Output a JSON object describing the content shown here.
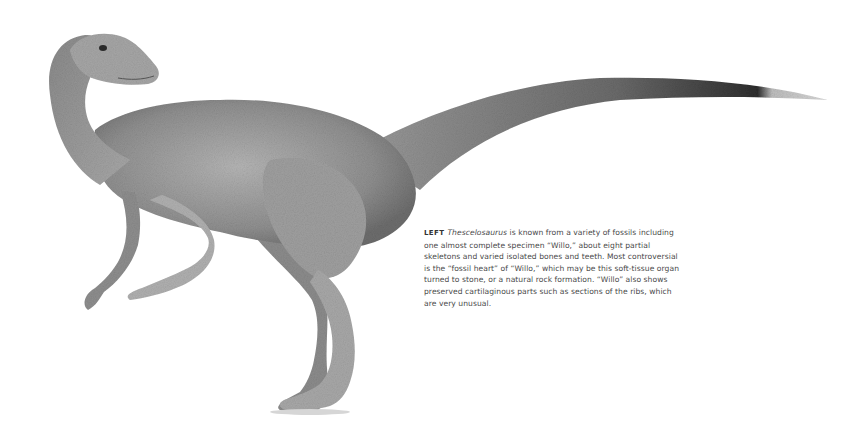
{
  "illustration": {
    "subject": "Thescelosaurus",
    "description": "Grayscale painted illustration of a bipedal ornithischian dinosaur in side view, neck curved back, long tapering tail extending right",
    "colors": {
      "body_light": "#b8b8b8",
      "body_mid": "#8e8e8e",
      "body_dark": "#5a5a5a",
      "tail_dark": "#3a3a3a",
      "tail_tip": "#c9c9c9"
    }
  },
  "caption": {
    "lead": "LEFT",
    "taxon": "Thescelosaurus",
    "text": " is known from a variety of fossils including one almost complete specimen “Willo,” about eight partial skeletons and varied isolated bones and teeth. Most controversial is the “fossil heart” of “Willo,” which may be this soft-tissue organ turned to stone, or a natural rock formation. “Willo” also shows preserved cartilaginous parts such as sections of the ribs, which are very unusual."
  }
}
